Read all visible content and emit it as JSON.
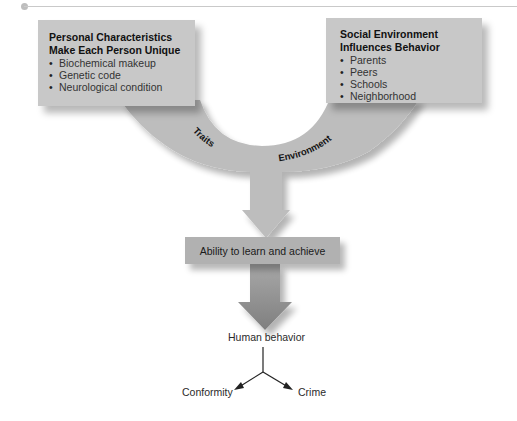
{
  "figure": {
    "left_box": {
      "title_line1": "Personal Characteristics",
      "title_line2": "Make Each Person Unique",
      "items": [
        "Biochemical makeup",
        "Genetic code",
        "Neurological condition"
      ]
    },
    "right_box": {
      "title_line1": "Social Environment",
      "title_line2": "Influences Behavior",
      "items": [
        "Parents",
        "Peers",
        "Schools",
        "Neighborhood"
      ]
    },
    "arc_labels": {
      "left": "Traits",
      "right": "Environment"
    },
    "middle_box": {
      "label": "Ability to learn and achieve"
    },
    "outcome": {
      "label": "Human behavior",
      "branches": {
        "left": "Conformity",
        "right": "Crime"
      }
    },
    "colors": {
      "box_fill": "#c8c8c8",
      "flow_fill": "#bdbdbd",
      "middle_box_fill": "#b1b1b1",
      "lower_arrow_fill": "#8f8f8f",
      "line": "#222222"
    }
  }
}
